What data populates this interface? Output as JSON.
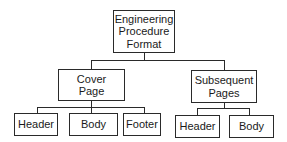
{
  "diagram": {
    "type": "tree",
    "root": {
      "label": "Engineering\nProcedure\nFormat"
    },
    "children": [
      {
        "label": "Cover\nPage",
        "children": [
          {
            "label": "Header"
          },
          {
            "label": "Body"
          },
          {
            "label": "Footer"
          }
        ]
      },
      {
        "label": "Subsequent\nPages",
        "children": [
          {
            "label": "Header"
          },
          {
            "label": "Body"
          }
        ]
      }
    ]
  },
  "colors": {
    "line": "#2a2a2a",
    "background": "#ffffff",
    "text": "#1a1a1a"
  }
}
